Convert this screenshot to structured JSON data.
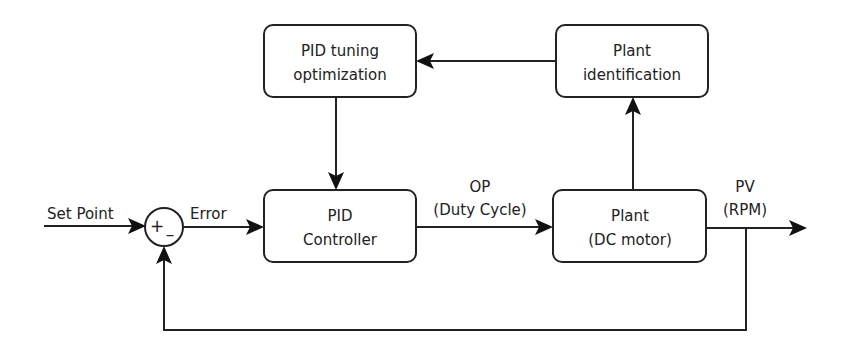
{
  "diagram": {
    "type": "block-diagram",
    "colors": {
      "stroke": "#222222",
      "background": "#ffffff"
    },
    "blocks": {
      "pid_tuning": {
        "line1": "PID tuning",
        "line2": "optimization"
      },
      "plant_id": {
        "line1": "Plant",
        "line2": "identification"
      },
      "pid_controller": {
        "line1": "PID",
        "line2": "Controller"
      },
      "plant": {
        "line1": "Plant",
        "line2": "(DC motor)"
      }
    },
    "summing_junction": {
      "plus": "+",
      "minus": "–"
    },
    "labels": {
      "set_point": "Set Point",
      "error": "Error",
      "op_line1": "OP",
      "op_line2": "(Duty Cycle)",
      "pv_line1": "PV",
      "pv_line2": "(RPM)"
    },
    "connections": [
      {
        "from": "Set Point",
        "to": "summing_junction"
      },
      {
        "from": "summing_junction",
        "to": "PID Controller",
        "label": "Error"
      },
      {
        "from": "PID Controller",
        "to": "Plant (DC motor)",
        "label": "OP (Duty Cycle)"
      },
      {
        "from": "Plant (DC motor)",
        "to": "output",
        "label": "PV (RPM)"
      },
      {
        "from": "output",
        "to": "summing_junction",
        "type": "feedback",
        "sign": "-"
      },
      {
        "from": "Plant (DC motor)",
        "to": "Plant identification"
      },
      {
        "from": "Plant identification",
        "to": "PID tuning optimization"
      },
      {
        "from": "PID tuning optimization",
        "to": "PID Controller"
      }
    ]
  }
}
